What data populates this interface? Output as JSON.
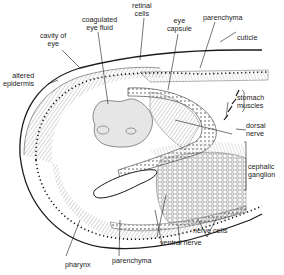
{
  "diagram": {
    "labels": {
      "cavity_of_eye": [
        "cavity of",
        "eye"
      ],
      "coagulated_eye_fluid": [
        "coagulated",
        "eye fluid"
      ],
      "retinal_cells": [
        "retinal",
        "cells"
      ],
      "eye_capsule": [
        "eye",
        "capsule"
      ],
      "parenchyma_top": [
        "parenchyma"
      ],
      "cuticle": [
        "cuticle"
      ],
      "altered_epidermis": [
        "altered",
        "epidermis"
      ],
      "stomach_muscles": [
        "stomach",
        "muscles"
      ],
      "dorsal_nerve": [
        "dorsal",
        "nerve"
      ],
      "cephalic_ganglion": [
        "cephalic",
        "ganglion"
      ],
      "nerve_cells": [
        "nerve cells"
      ],
      "ventral_nerve": [
        "ventral nerve"
      ],
      "parenchyma_bottom": [
        "parenchyma"
      ],
      "pharynx": [
        "pharynx"
      ]
    },
    "colors": {
      "ink": "#1a1a1a",
      "hatch": "#6a6a6a",
      "fluid": "#e6e6e6",
      "background": "#ffffff"
    }
  }
}
